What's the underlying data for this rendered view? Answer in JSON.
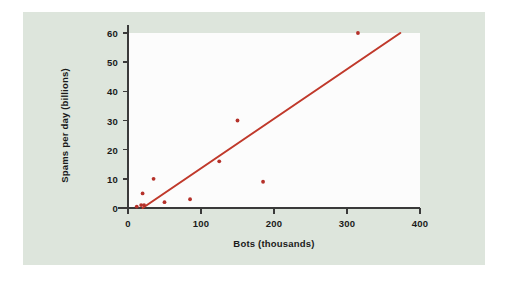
{
  "figure": {
    "panel_color": "#dde5dc",
    "plot_background": "#fcfcfc",
    "outer_background": "#ffffff",
    "axis_color": "#3a3a3a",
    "marker_color": "#b5312a",
    "line_color": "#c0392b"
  },
  "chart_data": {
    "type": "scatter",
    "title": "",
    "xlabel": "Bots (thousands)",
    "ylabel": "Spams per day (billions)",
    "xlim": [
      0,
      400
    ],
    "ylim": [
      0,
      60
    ],
    "xticks": [
      0,
      100,
      200,
      300,
      400
    ],
    "yticks": [
      0,
      10,
      20,
      30,
      40,
      50,
      60
    ],
    "xtick_labels": [
      "0",
      "100",
      "200",
      "300",
      "400"
    ],
    "ytick_labels": [
      "0",
      "10",
      "20",
      "30",
      "40",
      "50",
      "60"
    ],
    "grid": false,
    "legend": null,
    "points": [
      {
        "x": 12,
        "y": 0.5
      },
      {
        "x": 18,
        "y": 1
      },
      {
        "x": 20,
        "y": 5
      },
      {
        "x": 22,
        "y": 1
      },
      {
        "x": 35,
        "y": 10
      },
      {
        "x": 50,
        "y": 2
      },
      {
        "x": 85,
        "y": 3
      },
      {
        "x": 125,
        "y": 16
      },
      {
        "x": 150,
        "y": 30
      },
      {
        "x": 185,
        "y": 9
      },
      {
        "x": 315,
        "y": 60
      }
    ],
    "trendline": {
      "type": "linear",
      "x_start": 20,
      "y_start": 0,
      "x_end": 373,
      "y_end": 60
    }
  }
}
